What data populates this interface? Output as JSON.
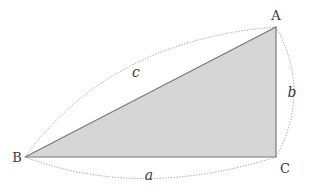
{
  "diagram": {
    "type": "right-triangle",
    "colors": {
      "fill": "#d6d6d6",
      "edge": "#7a7a7a",
      "arc": "#9a9a9a",
      "text": "#3a3a3a"
    },
    "vertices": {
      "A": {
        "label": "A",
        "x": 276,
        "y": 27
      },
      "B": {
        "label": "B",
        "x": 25,
        "y": 157
      },
      "C": {
        "label": "C",
        "x": 276,
        "y": 157
      }
    },
    "sides": {
      "a": {
        "label": "a",
        "from": "B",
        "to": "C"
      },
      "b": {
        "label": "b",
        "from": "A",
        "to": "C"
      },
      "c": {
        "label": "c",
        "from": "B",
        "to": "A"
      }
    }
  }
}
